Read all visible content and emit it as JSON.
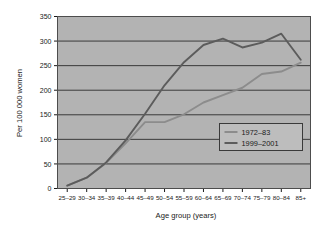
{
  "chart_data": {
    "type": "line",
    "title": "",
    "xlabel": "Age group (years)",
    "ylabel": "Per 100 000 women",
    "categories": [
      "25–29",
      "30–34",
      "35–39",
      "40–44",
      "45–49",
      "50–54",
      "55–59",
      "60–64",
      "65–69",
      "70–74",
      "75–79",
      "80–84",
      "85+"
    ],
    "ylim": [
      0,
      350
    ],
    "ytick_labels": [
      "0",
      "50",
      "100",
      "150",
      "200",
      "250",
      "300",
      "350"
    ],
    "ytick_values": [
      0,
      50,
      100,
      150,
      200,
      250,
      300,
      350
    ],
    "grid": true,
    "legend_position": "center-right",
    "series": [
      {
        "name": "1972–83",
        "color": "#8c8c8c",
        "values": [
          6,
          22,
          52,
          92,
          135,
          135,
          151,
          175,
          190,
          205,
          233,
          238,
          256
        ]
      },
      {
        "name": "1999–2001",
        "color": "#5c5c5c",
        "values": [
          6,
          22,
          53,
          98,
          152,
          210,
          257,
          292,
          305,
          287,
          297,
          315,
          262
        ]
      }
    ]
  },
  "legend": {
    "entries": [
      {
        "label": "1972–83"
      },
      {
        "label": "1999–2001"
      }
    ]
  },
  "colors": {
    "plot_background": "#b3b3b3",
    "grid_line": "#3a3a3a",
    "frame": "#4d4d4d",
    "series_1972": "#8c8c8c",
    "series_1999": "#5c5c5c",
    "legend_background": "#bdbdbd",
    "text": "#1a1a1a"
  }
}
